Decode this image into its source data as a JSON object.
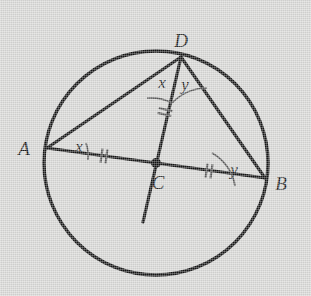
{
  "figure": {
    "background_color": "#d6d6d4",
    "stroke_color": "#141414",
    "arc_color": "#4a4a4a",
    "tick_color": "#5a5a5a",
    "circle": {
      "cx": 156,
      "cy": 163,
      "r": 112,
      "stroke_width": 3.4
    },
    "points": [
      {
        "name": "A",
        "label": "A",
        "x": 47,
        "y": 148,
        "label_x": 24,
        "label_y": 153
      },
      {
        "name": "B",
        "label": "B",
        "x": 265,
        "y": 178,
        "label_x": 277,
        "label_y": 189
      },
      {
        "name": "C",
        "label": "C",
        "x": 156,
        "y": 163,
        "label_x": 152,
        "label_y": 186
      },
      {
        "name": "D",
        "label": "D",
        "x": 181,
        "y": 57,
        "label_x": 172,
        "label_y": 46
      }
    ],
    "center_dot": {
      "x": 156,
      "y": 163,
      "r": 5
    },
    "segments": [
      {
        "name": "segment-AB",
        "from": "A",
        "to": "B",
        "x1": 47,
        "y1": 148,
        "x2": 265,
        "y2": 178
      },
      {
        "name": "segment-AD",
        "from": "A",
        "to": "D",
        "x1": 47,
        "y1": 148,
        "x2": 181,
        "y2": 57
      },
      {
        "name": "segment-DB",
        "from": "D",
        "to": "B",
        "x1": 181,
        "y1": 57,
        "x2": 265,
        "y2": 178
      },
      {
        "name": "segment-DC-extended",
        "from": "D",
        "to": "extension",
        "x1": 181,
        "y1": 57,
        "x2": 143,
        "y2": 222
      }
    ],
    "angle_labels": [
      {
        "name": "angle-x-at-A",
        "text": "x",
        "x": 73,
        "y": 148
      },
      {
        "name": "angle-x-at-D",
        "text": "x",
        "x": 155,
        "y": 85
      },
      {
        "name": "angle-y-at-D",
        "text": "y",
        "x": 177,
        "y": 87
      },
      {
        "name": "angle-y-at-B",
        "text": "y",
        "x": 229,
        "y": 170
      }
    ],
    "angle_arcs": [
      {
        "name": "arc-at-A",
        "d": "M 86 143 A 40 40 0 0 1 88 160"
      },
      {
        "name": "arc-at-D-left",
        "d": "M 147 98 A 46 46 0 0 1 172 103"
      },
      {
        "name": "arc-at-D-right",
        "d": "M 172 103 A 48 48 0 0 1 206 90"
      },
      {
        "name": "arc-at-B",
        "d": "M 212 154 A 44 44 0 0 1 234 185"
      }
    ],
    "tick_marks": [
      {
        "name": "tick-on-AC",
        "x": 104,
        "y": 156,
        "angle": 8,
        "count": 2
      },
      {
        "name": "tick-on-CB",
        "x": 209,
        "y": 171,
        "angle": 8,
        "count": 2
      },
      {
        "name": "tick-on-CD",
        "x": 165,
        "y": 112,
        "angle": -77,
        "count": 2
      }
    ]
  }
}
